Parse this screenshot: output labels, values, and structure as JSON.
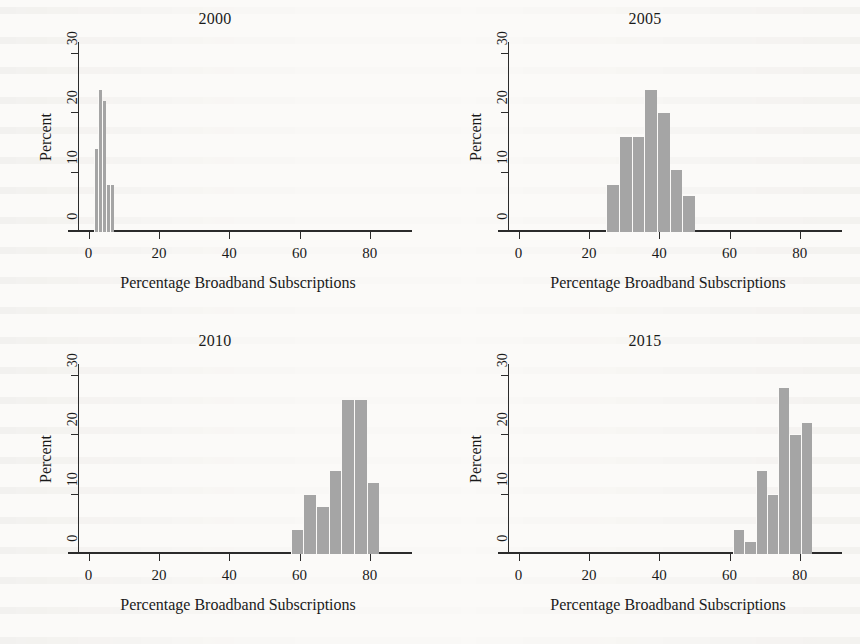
{
  "figure": {
    "panel_layout": "2x2",
    "bar_color": "#a5a5a5",
    "axis_color": "#2b2b2b",
    "background": "#fbfaf8"
  },
  "axes": {
    "ylabel": "Percent",
    "xlabel": "Percentage Broadband Subscriptions",
    "yticks": [
      "0",
      "10",
      "20",
      "30"
    ],
    "xticks": [
      "0",
      "20",
      "40",
      "60",
      "80"
    ]
  },
  "chart_data": [
    {
      "type": "bar",
      "title": "2000",
      "xlabel": "Percentage Broadband Subscriptions",
      "ylabel": "Percent",
      "xlim": [
        -3,
        88
      ],
      "ylim": [
        0,
        32
      ],
      "xticks": [
        0,
        20,
        40,
        60,
        80
      ],
      "yticks": [
        0,
        10,
        20,
        30
      ],
      "grid": false,
      "bin_width": 1.1,
      "bin_starts": [
        1.6,
        2.7,
        3.8,
        4.9,
        6.0
      ],
      "categories": [
        "1.6-2.7",
        "2.7-3.8",
        "3.8-4.9",
        "4.9-6.0",
        "6.0-7.1"
      ],
      "values": [
        14,
        24,
        22,
        8,
        8
      ]
    },
    {
      "type": "bar",
      "title": "2005",
      "xlabel": "Percentage Broadband Subscriptions",
      "ylabel": "Percent",
      "xlim": [
        -3,
        88
      ],
      "ylim": [
        0,
        32
      ],
      "xticks": [
        0,
        20,
        40,
        60,
        80
      ],
      "yticks": [
        0,
        10,
        20,
        30
      ],
      "grid": false,
      "bin_width": 3.6,
      "bin_starts": [
        25.0,
        28.6,
        32.2,
        35.8,
        39.4,
        43.0,
        46.6
      ],
      "categories": [
        "25-28.6",
        "28.6-32.2",
        "32.2-35.8",
        "35.8-39.4",
        "39.4-43",
        "43-46.6",
        "46.6-50.2"
      ],
      "values": [
        8,
        16,
        16,
        24,
        20,
        10.5,
        6
      ]
    },
    {
      "type": "bar",
      "title": "2010",
      "xlabel": "Percentage Broadband Subscriptions",
      "ylabel": "Percent",
      "xlim": [
        -3,
        88
      ],
      "ylim": [
        0,
        32
      ],
      "xticks": [
        0,
        20,
        40,
        60,
        80
      ],
      "yticks": [
        0,
        10,
        20,
        30
      ],
      "grid": false,
      "bin_width": 3.6,
      "bin_starts": [
        57.5,
        61.1,
        64.7,
        68.3,
        71.9,
        75.5,
        79.1
      ],
      "categories": [
        "57.5-61.1",
        "61.1-64.7",
        "64.7-68.3",
        "68.3-71.9",
        "71.9-75.5",
        "75.5-79.1",
        "79.1-82.7"
      ],
      "values": [
        4,
        10,
        8,
        14,
        26,
        26,
        12
      ]
    },
    {
      "type": "bar",
      "title": "2015",
      "xlabel": "Percentage Broadband Subscriptions",
      "ylabel": "Percent",
      "xlim": [
        -3,
        88
      ],
      "ylim": [
        0,
        32
      ],
      "xticks": [
        0,
        20,
        40,
        60,
        80
      ],
      "yticks": [
        0,
        10,
        20,
        30
      ],
      "grid": false,
      "bin_width": 3.2,
      "bin_starts": [
        61.0,
        64.2,
        67.4,
        70.6,
        73.8,
        77.0,
        80.2
      ],
      "categories": [
        "61-64.2",
        "64.2-67.4",
        "67.4-70.6",
        "70.6-73.8",
        "73.8-77",
        "77-80.2",
        "80.2-83.4"
      ],
      "values": [
        4,
        2,
        14,
        10,
        28,
        20,
        22
      ]
    }
  ]
}
